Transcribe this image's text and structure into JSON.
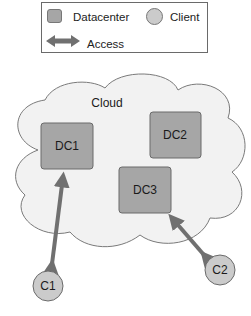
{
  "legend": {
    "datacenter_label": "Datacenter",
    "client_label": "Client",
    "access_label": "Access"
  },
  "cloud": {
    "label": "Cloud"
  },
  "datacenters": [
    {
      "id": "DC1",
      "label": "DC1"
    },
    {
      "id": "DC2",
      "label": "DC2"
    },
    {
      "id": "DC3",
      "label": "DC3"
    }
  ],
  "clients": [
    {
      "id": "C1",
      "label": "C1"
    },
    {
      "id": "C2",
      "label": "C2"
    }
  ],
  "access_links": [
    {
      "from": "C1",
      "to": "DC1"
    },
    {
      "from": "C2",
      "to": "DC3"
    }
  ],
  "colors": {
    "datacenter_fill": "#a6a6a6",
    "client_fill": "#cbcbcb",
    "cloud_fill": "#f2f2f2",
    "arrow": "#707070",
    "outline": "#6a6a6a"
  }
}
